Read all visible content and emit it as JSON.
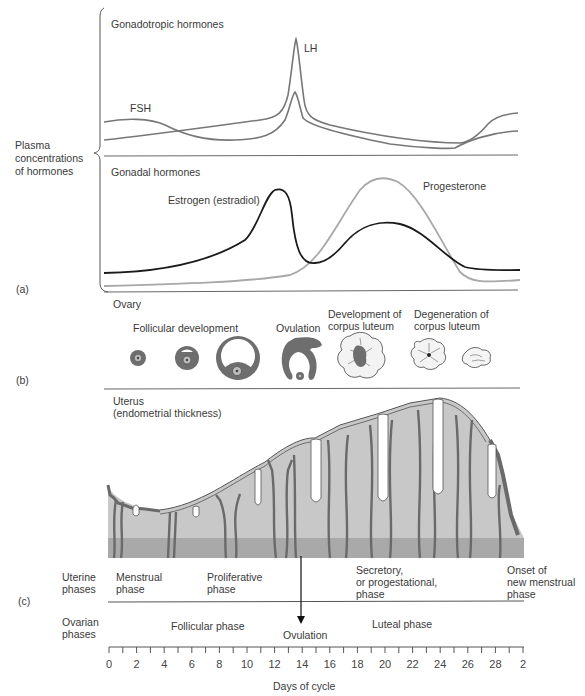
{
  "figure": {
    "panel_labels": {
      "a": "(a)",
      "b": "(b)",
      "c": "(c)"
    },
    "plasma_label": "Plasma\nconcentrations\nof hormones"
  },
  "gonadotropic": {
    "title": "Gonadotropic hormones",
    "lh_label": "LH",
    "fsh_label": "FSH"
  },
  "gonadal": {
    "title": "Gonadal hormones",
    "estrogen_label": "Estrogen  (estradiol)",
    "progesterone_label": "Progesterone"
  },
  "ovary": {
    "title": "Ovary",
    "stages": [
      {
        "label": "Follicular development"
      },
      {
        "label": "Ovulation"
      },
      {
        "label": "Development of\ncorpus luteum"
      },
      {
        "label": "Degeneration of\ncorpus luteum"
      }
    ]
  },
  "uterus": {
    "title": "Uterus\n(endometrial thickness)"
  },
  "uterine_phases": {
    "row_label": "Uterine\nphases",
    "phases": [
      {
        "label": "Menstrual\nphase"
      },
      {
        "label": "Proliferative\nphase"
      },
      {
        "label": "Secretory,\nor progestational,\nphase"
      },
      {
        "label": "Onset of\nnew menstrual\nphase"
      }
    ]
  },
  "ovarian_phases": {
    "row_label": "Ovarian\nphases",
    "phases": [
      {
        "label": "Follicular phase"
      },
      {
        "label": "Luteal phase"
      }
    ],
    "ovulation_label": "Ovulation"
  },
  "axis": {
    "title": "Days of cycle",
    "tick_labels": [
      "0",
      "2",
      "4",
      "6",
      "8",
      "10",
      "12",
      "14",
      "16",
      "18",
      "20",
      "22",
      "24",
      "26",
      "28",
      "2"
    ]
  },
  "colors": {
    "hormone_gray": "#7a7a7a",
    "estrogen": "#1a1a1a",
    "progesterone": "#aaaaaa",
    "tissue_light": "#c8c8c8",
    "tissue_dark": "#a9a9a9",
    "vessel": "#6a6a6a"
  },
  "chart_data": {
    "type": "line",
    "xlabel": "Days of cycle",
    "ylabel": "Plasma concentrations of hormones",
    "x": [
      0,
      2,
      4,
      6,
      8,
      10,
      12,
      13,
      14,
      15,
      16,
      18,
      20,
      22,
      24,
      26,
      28
    ],
    "series": [
      {
        "name": "LH",
        "panel": "Gonadotropic hormones",
        "values": [
          15,
          17,
          19,
          21,
          23,
          25,
          28,
          40,
          100,
          30,
          20,
          15,
          12,
          10,
          9,
          9,
          15
        ]
      },
      {
        "name": "FSH",
        "panel": "Gonadotropic hormones",
        "values": [
          30,
          30,
          25,
          18,
          14,
          12,
          14,
          25,
          55,
          18,
          12,
          9,
          7,
          6,
          5,
          14,
          24
        ]
      },
      {
        "name": "Estrogen (estradiol)",
        "panel": "Gonadal hormones",
        "values": [
          10,
          11,
          13,
          18,
          28,
          50,
          85,
          90,
          40,
          15,
          25,
          45,
          50,
          45,
          25,
          12,
          10
        ]
      },
      {
        "name": "Progesterone",
        "panel": "Gonadal hormones",
        "values": [
          5,
          5,
          5,
          5,
          6,
          7,
          9,
          12,
          18,
          35,
          65,
          90,
          95,
          80,
          45,
          10,
          6
        ]
      }
    ],
    "annotations": [
      "LH surge near day 14",
      "Ovulation at day 14"
    ],
    "grid": false
  }
}
